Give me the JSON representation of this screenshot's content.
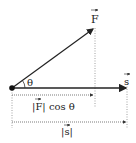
{
  "diagram": {
    "vectors": {
      "force": {
        "label": "F",
        "has_arrow_accent": true
      },
      "displacement": {
        "label": "s",
        "has_arrow_accent": true
      }
    },
    "angle_label": "θ",
    "projection_label": "|F| cos θ",
    "projection_label_parts": {
      "bar_open": "|",
      "vec": "F",
      "bar_close": "|",
      "func": " cos θ"
    },
    "magnitude_label_parts": {
      "bar_open": "|",
      "vec": "s",
      "bar_close": "|"
    },
    "colors": {
      "line": "#222222",
      "dotted": "#777777",
      "background": "#ffffff"
    }
  }
}
